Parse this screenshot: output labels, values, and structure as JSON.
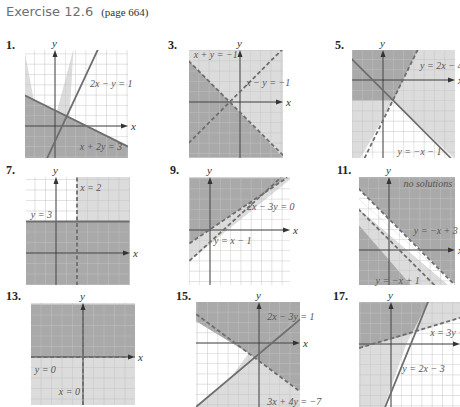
{
  "header": {
    "title": "Exercise 12.6",
    "page_ref": "(page 664)"
  },
  "colors": {
    "light_shade": "#dcdcdc",
    "dark_shade": "#a9a9a9",
    "grid": "#c4c4c4",
    "axis": "#333333",
    "line": "#6e6e6e",
    "white": "#ffffff"
  },
  "graphs": [
    {
      "number": "1.",
      "num_pos": [
        6,
        38
      ],
      "box": [
        25,
        50,
        128,
        158
      ],
      "origin": [
        55,
        126
      ],
      "unit": 10.3,
      "base_fill": "light",
      "regions": [
        {
          "fill": "white",
          "poly": [
            [
              -3,
              7.5
            ],
            [
              1.8,
              7.5
            ],
            [
              -1,
              -3
            ]
          ]
        },
        {
          "fill": "dark",
          "poly": [
            [
              -3,
              3
            ],
            [
              7.1,
              -2
            ],
            [
              7.1,
              -3.2
            ],
            [
              -3,
              -3.2
            ]
          ]
        },
        {
          "fill": "white",
          "poly": [
            [
              1.8,
              7.5
            ],
            [
              7.1,
              7.5
            ],
            [
              7.1,
              -2
            ],
            [
              1.4,
              0.8
            ]
          ]
        }
      ],
      "lines": [
        {
          "p1": [
            -0.8,
            -3.2
          ],
          "p2": [
            4.2,
            7.5
          ],
          "dashed": false
        },
        {
          "p1": [
            -3,
            3
          ],
          "p2": [
            7.1,
            -2
          ],
          "dashed": false
        }
      ],
      "labels": [
        {
          "text": "2x − y = 1",
          "at": [
            3.4,
            3.8
          ]
        },
        {
          "text": "x + 2y = 3",
          "at": [
            2.4,
            -2.3
          ]
        }
      ]
    },
    {
      "number": "3.",
      "num_pos": [
        168,
        38
      ],
      "box": [
        189,
        50,
        283,
        158
      ],
      "origin": [
        240,
        102
      ],
      "unit": 10.3,
      "base_fill": "light",
      "regions": [
        {
          "fill": "dark",
          "poly": [
            [
              -5,
              4
            ],
            [
              -1,
              0
            ],
            [
              -5,
              -4
            ]
          ]
        },
        {
          "fill": "dark",
          "poly": [
            [
              -1,
              0
            ],
            [
              -5,
              -4
            ],
            [
              -5,
              -5.4
            ],
            [
              4.2,
              -5.4
            ]
          ]
        },
        {
          "fill": "light",
          "poly": [
            [
              -1,
              0
            ],
            [
              4.2,
              -5.2
            ],
            [
              4.2,
              5.2
            ]
          ]
        }
      ],
      "lines": [
        {
          "p1": [
            -5,
            4
          ],
          "p2": [
            4.4,
            -5.4
          ],
          "dashed": true
        },
        {
          "p1": [
            -5,
            -4
          ],
          "p2": [
            4.2,
            5.2
          ],
          "dashed": true
        }
      ],
      "labels": [
        {
          "text": "x + y = −1",
          "at": [
            -4.5,
            4.3
          ]
        },
        {
          "text": "x − y = −1",
          "at": [
            0.6,
            1.6
          ]
        }
      ]
    },
    {
      "number": "5.",
      "num_pos": [
        335,
        38
      ],
      "box": [
        352,
        50,
        455,
        158
      ],
      "origin": [
        383,
        80
      ],
      "unit": 10.3,
      "base_fill": "light",
      "regions": [
        {
          "fill": "dark",
          "poly": [
            [
              -3,
              3
            ],
            [
              3.4,
              3
            ],
            [
              1,
              -2
            ],
            [
              -3,
              -2
            ]
          ]
        },
        {
          "fill": "white",
          "poly": [
            [
              1,
              -2
            ],
            [
              -2.2,
              -7.6
            ],
            [
              7,
              -7.6
            ],
            [
              7,
              -7.7
            ]
          ]
        },
        {
          "fill": "white",
          "poly": [
            [
              1,
              -2
            ],
            [
              -1.8,
              -7.6
            ],
            [
              6.6,
              -7.6
            ]
          ]
        }
      ],
      "lines": [
        {
          "p1": [
            -1.8,
            -7.6
          ],
          "p2": [
            3.4,
            3
          ],
          "dashed": true
        },
        {
          "p1": [
            -3.6,
            2.6
          ],
          "p2": [
            6.6,
            -7.6
          ],
          "dashed": false
        }
      ],
      "labels": [
        {
          "text": "y = 2x − 4",
          "at": [
            3.6,
            1.1
          ]
        },
        {
          "text": "y = −x − 1",
          "at": [
            1.4,
            -7.3
          ]
        }
      ]
    },
    {
      "number": "7.",
      "num_pos": [
        6,
        163
      ],
      "box": [
        26,
        177,
        130,
        285
      ],
      "origin": [
        56,
        253
      ],
      "unit": 10.5,
      "base_fill": "light",
      "regions": [
        {
          "fill": "white",
          "poly": [
            [
              -3,
              7.3
            ],
            [
              2,
              7.3
            ],
            [
              2,
              3
            ],
            [
              -3,
              3
            ]
          ]
        },
        {
          "fill": "dark",
          "poly": [
            [
              -3,
              3
            ],
            [
              7,
              3
            ],
            [
              7,
              -3.1
            ],
            [
              -3,
              -3.1
            ]
          ]
        }
      ],
      "lines": [
        {
          "p1": [
            2,
            -3.1
          ],
          "p2": [
            2,
            7.3
          ],
          "dashed": true
        },
        {
          "p1": [
            -3,
            3
          ],
          "p2": [
            7,
            3
          ],
          "dashed": false
        }
      ],
      "labels": [
        {
          "text": "x = 2",
          "at": [
            2.3,
            5.9
          ]
        },
        {
          "text": "y = 3",
          "at": [
            -2.4,
            3.3
          ]
        }
      ]
    },
    {
      "number": "9.",
      "num_pos": [
        170,
        163
      ],
      "box": [
        189,
        177,
        290,
        285
      ],
      "origin": [
        210,
        230
      ],
      "unit": 10.3,
      "base_fill": "white",
      "regions": [
        {
          "fill": "dark",
          "poly": [
            [
              -2,
              5.1
            ],
            [
              7.5,
              5.1
            ],
            [
              -2,
              -1.3
            ]
          ]
        },
        {
          "fill": "light",
          "poly": [
            [
              -2,
              -1.3
            ],
            [
              7.5,
              5.1
            ],
            [
              8,
              5.1
            ],
            [
              8,
              5.1
            ],
            [
              -2,
              -3
            ]
          ]
        }
      ],
      "lines": [
        {
          "p1": [
            -2,
            -1.3
          ],
          "p2": [
            7.5,
            5.1
          ],
          "dashed": true
        },
        {
          "p1": [
            -2,
            -3
          ],
          "p2": [
            6.9,
            5.1
          ],
          "dashed": true
        }
      ],
      "labels": [
        {
          "text": "2x − 3y = 0",
          "at": [
            3.6,
            1.9
          ]
        },
        {
          "text": "y = x − 1",
          "at": [
            0.4,
            -1.4
          ]
        }
      ]
    },
    {
      "number": "11.",
      "num_pos": [
        337,
        163
      ],
      "box": [
        359,
        177,
        455,
        285
      ],
      "origin": [
        389,
        250
      ],
      "unit": 10.3,
      "base_fill": "dark",
      "regions": [
        {
          "fill": "white",
          "poly": [
            [
              -3,
              5
            ],
            [
              -3,
              4
            ],
            [
              5.8,
              -3.5
            ],
            [
              6.5,
              -3.5
            ]
          ]
        },
        {
          "fill": "light",
          "poly": [
            [
              -3,
              4
            ],
            [
              5.8,
              -3.5
            ],
            [
              2.2,
              -3.5
            ],
            [
              -3,
              2.5
            ]
          ]
        },
        {
          "fill": "white",
          "poly": [
            [
              -3,
              6
            ],
            [
              -3,
              5
            ],
            [
              6.5,
              -3.5
            ],
            [
              6.6,
              -3.5
            ]
          ]
        }
      ],
      "lines": [
        {
          "p1": [
            -3,
            6
          ],
          "p2": [
            6.5,
            -3.5
          ],
          "dashed": true
        },
        {
          "p1": [
            -3,
            4
          ],
          "p2": [
            4.5,
            -3.5
          ],
          "dashed": true
        }
      ],
      "labels": [
        {
          "text": "no solutions",
          "at": [
            1.4,
            6.1
          ]
        },
        {
          "text": "y = −x + 3",
          "at": [
            2.4,
            1.6
          ]
        },
        {
          "text": "y = −x + 1",
          "at": [
            -1.3,
            -3.3
          ]
        }
      ]
    },
    {
      "number": "13.",
      "num_pos": [
        6,
        289
      ],
      "box": [
        31,
        303,
        135,
        405
      ],
      "origin": [
        83,
        357
      ],
      "unit": 10.5,
      "base_fill": "light",
      "regions": [
        {
          "fill": "dark",
          "poly": [
            [
              -5,
              5
            ],
            [
              5,
              5
            ],
            [
              5,
              0
            ],
            [
              -5,
              0
            ]
          ]
        },
        {
          "fill": "light",
          "poly": [
            [
              0,
              0
            ],
            [
              5,
              0
            ],
            [
              5,
              -4.6
            ],
            [
              0,
              -4.6
            ]
          ]
        }
      ],
      "lines": [
        {
          "p1": [
            -5,
            0
          ],
          "p2": [
            5,
            0
          ],
          "dashed": true
        },
        {
          "p1": [
            0,
            -4.6
          ],
          "p2": [
            0,
            5
          ],
          "dashed": true
        }
      ],
      "labels": [
        {
          "text": "y = 0",
          "at": [
            -4.6,
            -1.5
          ]
        },
        {
          "text": "x = 0",
          "at": [
            -2.3,
            -3.6
          ]
        }
      ]
    },
    {
      "number": "15.",
      "num_pos": [
        176,
        289
      ],
      "box": [
        196,
        302,
        300,
        407
      ],
      "origin": [
        259,
        343
      ],
      "unit": 10.3,
      "base_fill": "light",
      "regions": [
        {
          "fill": "white",
          "poly": [
            [
              -6.1,
              2.1
            ],
            [
              -6.1,
              -6.2
            ],
            [
              -3,
              -3.7
            ],
            [
              -1,
              -1
            ]
          ]
        },
        {
          "fill": "dark",
          "poly": [
            [
              -1,
              -1
            ],
            [
              4.1,
              2.4
            ],
            [
              4.1,
              -4.7
            ]
          ]
        },
        {
          "fill": "dark",
          "poly": [
            [
              -6.1,
              4
            ],
            [
              4.1,
              4
            ],
            [
              4.1,
              2.4
            ],
            [
              -1,
              -1
            ],
            [
              -6.1,
              2.1
            ]
          ]
        }
      ],
      "lines": [
        {
          "p1": [
            -6.1,
            -6.2
          ],
          "p2": [
            4.1,
            2.4
          ],
          "dashed": false
        },
        {
          "p1": [
            -6.1,
            2.8
          ],
          "p2": [
            4.1,
            -4.8
          ],
          "dashed": true
        }
      ],
      "labels": [
        {
          "text": "2x − 3y = 1",
          "at": [
            0.8,
            2.2
          ]
        },
        {
          "text": "3x + 4y = −7",
          "at": [
            0.8,
            -6.0
          ]
        }
      ]
    },
    {
      "number": "17.",
      "num_pos": [
        333,
        289
      ],
      "box": [
        359,
        302,
        460,
        407
      ],
      "origin": [
        391,
        344
      ],
      "unit": 10.3,
      "base_fill": "light",
      "regions": [
        {
          "fill": "dark",
          "poly": [
            [
              -3.1,
              4.1
            ],
            [
              3.6,
              4.1
            ],
            [
              2,
              1
            ],
            [
              -3.1,
              -0.4
            ]
          ]
        },
        {
          "fill": "white",
          "poly": [
            [
              2,
              1
            ],
            [
              6.9,
              2.6
            ],
            [
              6.9,
              -6.2
            ],
            [
              -0.7,
              -6.2
            ],
            [
              1.5,
              0
            ]
          ]
        }
      ],
      "lines": [
        {
          "p1": [
            -0.6,
            -6.2
          ],
          "p2": [
            3.6,
            4.1
          ],
          "dashed": false
        },
        {
          "p1": [
            -3.1,
            -0.4
          ],
          "p2": [
            6.9,
            2.6
          ],
          "dashed": true
        }
      ],
      "labels": [
        {
          "text": "x = 3y − 1",
          "at": [
            3.8,
            0.8
          ]
        },
        {
          "text": "y = 2x − 3",
          "at": [
            1.1,
            -2.7
          ]
        }
      ]
    }
  ]
}
